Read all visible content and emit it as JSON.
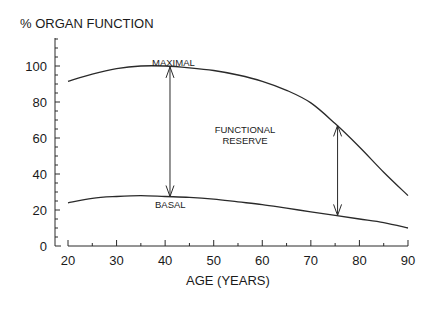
{
  "chart_data": {
    "type": "line",
    "title": "",
    "ylabel": "% ORGAN FUNCTION",
    "xlabel": "AGE (YEARS)",
    "xlim": [
      20,
      90
    ],
    "ylim": [
      0,
      115
    ],
    "x_ticks": [
      20,
      30,
      40,
      50,
      60,
      70,
      80,
      90
    ],
    "y_ticks": [
      0,
      20,
      40,
      60,
      80,
      100
    ],
    "grid": false,
    "legend": "none",
    "x": [
      20,
      25,
      30,
      35,
      40,
      45,
      50,
      55,
      60,
      65,
      70,
      75,
      80,
      85,
      90
    ],
    "series": [
      {
        "name": "MAXIMAL",
        "values": [
          91.5,
          95.5,
          98.5,
          100,
          100,
          99,
          97.5,
          95,
          91.5,
          86.5,
          79.5,
          68,
          55,
          41,
          28
        ]
      },
      {
        "name": "BASAL",
        "values": [
          24,
          26.5,
          27.5,
          28,
          27.5,
          27,
          26,
          24.5,
          23,
          21,
          19,
          17,
          15,
          13,
          10
        ]
      }
    ],
    "annotations": [
      {
        "text": "MAXIMAL",
        "x": 41,
        "y": 102
      },
      {
        "text": "BASAL",
        "x": 41,
        "y": 22
      },
      {
        "text": "FUNCTIONAL",
        "x": 55,
        "y": 64
      },
      {
        "text": "RESERVE",
        "x": 55,
        "y": 58
      },
      {
        "type": "double-arrow",
        "x": 41,
        "y_from": 27.5,
        "y_to": 99.5
      },
      {
        "type": "double-arrow",
        "x": 75.5,
        "y_from": 17,
        "y_to": 67
      }
    ]
  },
  "labels": {
    "ylabel": "% ORGAN FUNCTION",
    "xlabel": "AGE (YEARS)",
    "maximal": "MAXIMAL",
    "basal": "BASAL",
    "reserve_line1": "FUNCTIONAL",
    "reserve_line2": "RESERVE"
  }
}
